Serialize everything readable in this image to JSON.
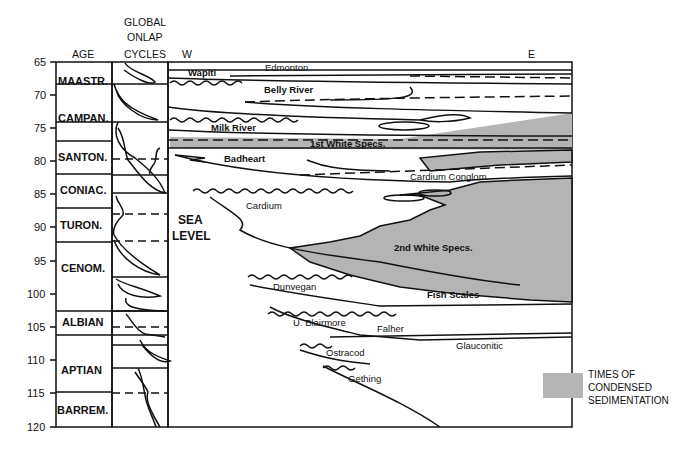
{
  "headers": {
    "age": "AGE",
    "onlap_line1": "GLOBAL",
    "onlap_line2": "ONLAP",
    "onlap_line3": "CYCLES",
    "west": "W",
    "east": "E"
  },
  "y_axis": {
    "ticks": [
      "65",
      "70",
      "75",
      "80",
      "85",
      "90",
      "95",
      "100",
      "105",
      "110",
      "115",
      "120"
    ]
  },
  "stages": [
    "MAASTR.",
    "CAMPAN.",
    "SANTON.",
    "CONIAC.",
    "TURON.",
    "CENOM.",
    "ALBIAN",
    "APTIAN",
    "BARREM."
  ],
  "sea_level": {
    "line1": "SEA",
    "line2": "LEVEL"
  },
  "units": {
    "wapiti": "Wapiti",
    "edmonton": "Edmonton",
    "belly_river": "Belly River",
    "milk_river": "Milk River",
    "first_white_specs": "1st White Specs.",
    "badheart": "Badheart",
    "cardium_conglom": "Cardium Conglom.",
    "cardium": "Cardium",
    "second_white_specs": "2nd White Specs.",
    "dunvegan": "Dunvegan",
    "fish_scales": "Fish Scales",
    "u_blairmore": "U. Blairmore",
    "falher": "Falher",
    "glauconitic": "Glauconitic",
    "ostracod": "Ostracod",
    "gething": "Gething"
  },
  "legend": {
    "line1": "TIMES OF",
    "line2": "CONDENSED",
    "line3": "SEDIMENTATION",
    "swatch_color": "#b4b4b4"
  },
  "colors": {
    "ink": "#111111",
    "condensed_fill": "#b4b4b4"
  }
}
